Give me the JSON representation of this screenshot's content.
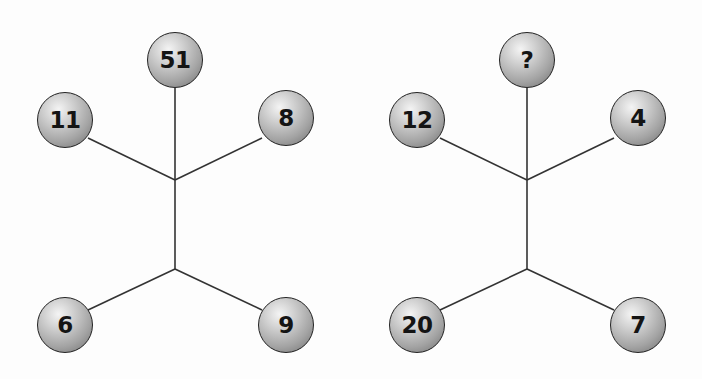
{
  "puzzle": {
    "left": {
      "top": "51",
      "upper_left": "11",
      "upper_right": "8",
      "lower_left": "6",
      "lower_right": "9"
    },
    "right": {
      "top": "?",
      "upper_left": "12",
      "upper_right": "4",
      "lower_left": "20",
      "lower_right": "7"
    }
  },
  "colors": {
    "line": "#333333",
    "text": "#141414",
    "background": "#fdfdfd"
  }
}
